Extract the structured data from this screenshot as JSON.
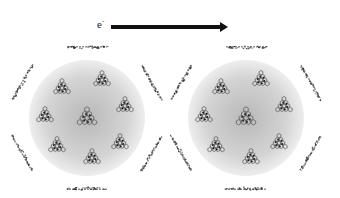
{
  "diagram": {
    "arrow": {
      "label": "e",
      "label_superscript": "-",
      "direction": "right",
      "x1": 111,
      "x2": 228,
      "y": 27,
      "color": "#111111"
    },
    "spheres": [
      {
        "id": "left-sphere",
        "cx": 87,
        "cy": 118,
        "r": 58,
        "fill_center": "#b8b8b8",
        "fill_edge": "#eeeeee"
      },
      {
        "id": "right-sphere",
        "cx": 246,
        "cy": 118,
        "r": 58,
        "fill_center": "#b8b8b8",
        "fill_edge": "#eeeeee"
      }
    ],
    "molecule_positions_relative": [
      {
        "dx": 0,
        "dy": 0,
        "role": "center"
      },
      {
        "dx": -25,
        "dy": -30
      },
      {
        "dx": 15,
        "dy": -38
      },
      {
        "dx": 38,
        "dy": -12
      },
      {
        "dx": 33,
        "dy": 25
      },
      {
        "dx": 5,
        "dy": 40
      },
      {
        "dx": -30,
        "dy": 28
      },
      {
        "dx": -42,
        "dy": -2
      }
    ],
    "edge_fragments": {
      "ring_radius": 75,
      "count": 6,
      "length": 40,
      "angles_deg": [
        -90,
        -30,
        30,
        90,
        150,
        210
      ],
      "color": "#333333"
    }
  }
}
